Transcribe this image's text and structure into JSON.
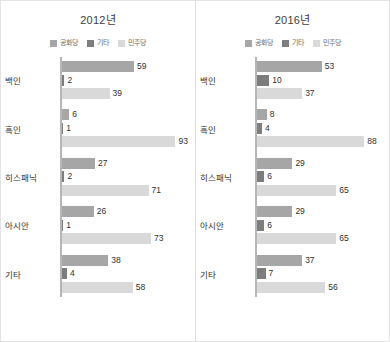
{
  "chart_data": {
    "type": "bar",
    "orientation": "horizontal",
    "title": "",
    "xlabel": "",
    "ylabel": "",
    "xlim": [
      0,
      100
    ],
    "grid": false,
    "legend_position": "top-center",
    "categories": [
      "백인",
      "흑인",
      "히스패닉",
      "아시안",
      "기타"
    ],
    "series_names": [
      "공화당",
      "기타",
      "민주당"
    ],
    "colors": {
      "republican": "#a6a6a6",
      "other": "#7d7d7d",
      "democrat": "#d9d9d9",
      "axis": "#b6b6b6",
      "divider": "#dddddd",
      "border": "#e3e3e3",
      "title_text": "#3d3d3d",
      "label_text": "#333333",
      "legend_text": "#6b6b6b",
      "value_text": "#2f2f2f"
    },
    "panels": [
      {
        "title": "2012년",
        "series": [
          {
            "name": "공화당",
            "values": [
              59,
              6,
              27,
              26,
              38
            ]
          },
          {
            "name": "기타",
            "values": [
              2,
              1,
              2,
              1,
              4
            ]
          },
          {
            "name": "민주당",
            "values": [
              39,
              93,
              71,
              73,
              58
            ]
          }
        ]
      },
      {
        "title": "2016년",
        "series": [
          {
            "name": "공화당",
            "values": [
              53,
              8,
              29,
              29,
              37
            ]
          },
          {
            "name": "기타",
            "values": [
              10,
              4,
              6,
              6,
              7
            ]
          },
          {
            "name": "민주당",
            "values": [
              37,
              88,
              65,
              65,
              56
            ]
          }
        ]
      }
    ]
  },
  "panels": [
    {
      "title": "2012년",
      "legend": [
        {
          "label": "공화당",
          "color": "#a6a6a6"
        },
        {
          "label": "기타",
          "color": "#7d7d7d"
        },
        {
          "label": "민주당",
          "color": "#d9d9d9"
        }
      ],
      "groups": [
        {
          "category": "백인",
          "bars": [
            {
              "value": 59
            },
            {
              "value": 2
            },
            {
              "value": 39
            }
          ]
        },
        {
          "category": "흑인",
          "bars": [
            {
              "value": 6
            },
            {
              "value": 1
            },
            {
              "value": 93
            }
          ]
        },
        {
          "category": "히스패닉",
          "bars": [
            {
              "value": 27
            },
            {
              "value": 2
            },
            {
              "value": 71
            }
          ]
        },
        {
          "category": "아시안",
          "bars": [
            {
              "value": 26
            },
            {
              "value": 1
            },
            {
              "value": 73
            }
          ]
        },
        {
          "category": "기타",
          "bars": [
            {
              "value": 38
            },
            {
              "value": 4
            },
            {
              "value": 58
            }
          ]
        }
      ]
    },
    {
      "title": "2016년",
      "legend": [
        {
          "label": "공화당",
          "color": "#a6a6a6"
        },
        {
          "label": "기타",
          "color": "#7d7d7d"
        },
        {
          "label": "민주당",
          "color": "#d9d9d9"
        }
      ],
      "groups": [
        {
          "category": "백인",
          "bars": [
            {
              "value": 53
            },
            {
              "value": 10
            },
            {
              "value": 37
            }
          ]
        },
        {
          "category": "흑인",
          "bars": [
            {
              "value": 8
            },
            {
              "value": 4
            },
            {
              "value": 88
            }
          ]
        },
        {
          "category": "히스패닉",
          "bars": [
            {
              "value": 29
            },
            {
              "value": 6
            },
            {
              "value": 65
            }
          ]
        },
        {
          "category": "아시안",
          "bars": [
            {
              "value": 29
            },
            {
              "value": 6
            },
            {
              "value": 65
            }
          ]
        },
        {
          "category": "기타",
          "bars": [
            {
              "value": 37
            },
            {
              "value": 7
            },
            {
              "value": 56
            }
          ]
        }
      ]
    }
  ]
}
